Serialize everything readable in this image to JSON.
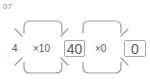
{
  "problem": {
    "number": "07",
    "start_value": "4",
    "step1": {
      "operator": "×10",
      "result": "40"
    },
    "step2": {
      "operator": "×0",
      "result": "0"
    }
  },
  "colors": {
    "stroke": "#9a9a9a",
    "text": "#5a5a5a",
    "label": "#8a8a8a"
  }
}
